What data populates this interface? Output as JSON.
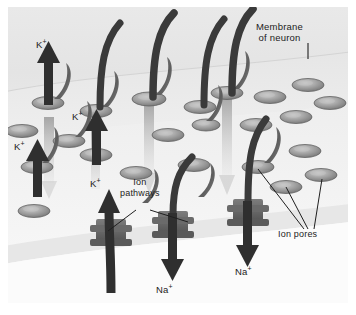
{
  "figure": {
    "style": "grayscale scientific illustration, 3D perspective slab",
    "panel_bg": "#e9e9e9",
    "margin_bg": "#ffffff"
  },
  "labels": {
    "membrane": {
      "line1": "Membrane",
      "line2": "of neuron"
    },
    "ion_pathways": {
      "line1": "Ion",
      "line2": "pathways"
    },
    "ion_pores": {
      "text": "Ion pores"
    }
  },
  "ions": {
    "potassium": {
      "symbol": "K",
      "charge": "+"
    },
    "sodium": {
      "symbol": "Na",
      "charge": "+"
    }
  },
  "ion_labels": [
    {
      "name": "k-plus-top",
      "symbol": "K",
      "charge": "+",
      "x": 36,
      "y": 36
    },
    {
      "name": "k-plus-middle",
      "symbol": "K",
      "charge": "+",
      "x": 70,
      "y": 110
    },
    {
      "name": "k-plus-left",
      "symbol": "K",
      "charge": "+",
      "x": 14,
      "y": 140
    },
    {
      "name": "k-plus-lower",
      "symbol": "K",
      "charge": "+",
      "x": 85,
      "y": 176
    },
    {
      "name": "na-plus-left",
      "symbol": "Na",
      "charge": "+",
      "x": 157,
      "y": 277
    },
    {
      "name": "na-plus-right",
      "symbol": "Na",
      "charge": "+",
      "x": 238,
      "y": 260
    }
  ],
  "colors": {
    "arrow_dark": "#3a3a3a",
    "arrow_dark_2": "#2e2e2e",
    "arrow_light": "#b9b9b9",
    "pore_rim": "#6f6f6f",
    "pore_face": "#9b9b9b",
    "pore_highlight": "#cfcfcf",
    "membrane_top": "#e2e2e2",
    "membrane_body": "#ededed",
    "below_membrane": "#fafafa",
    "leader_line": "#1f1f1f",
    "text": "#1c1c1c"
  },
  "counts": {
    "ion_pores_visible": 22,
    "potassium_arrows": 4,
    "sodium_arrows": 2,
    "inward_curved_arrows": 4,
    "ion_pathway_channels": 4
  },
  "leader_lines": {
    "membrane_of_neuron": [
      {
        "x1": 300,
        "y1": 36,
        "x2": 300,
        "y2": 52
      }
    ],
    "ion_pathways": [
      {
        "x1": 128,
        "y1": 201,
        "x2": 100,
        "y2": 222
      },
      {
        "x1": 140,
        "y1": 201,
        "x2": 182,
        "y2": 214
      }
    ],
    "ion_pores": [
      {
        "x1": 297,
        "y1": 224,
        "x2": 250,
        "y2": 160
      },
      {
        "x1": 300,
        "y1": 224,
        "x2": 278,
        "y2": 175
      },
      {
        "x1": 305,
        "y1": 224,
        "x2": 313,
        "y2": 168
      }
    ]
  }
}
